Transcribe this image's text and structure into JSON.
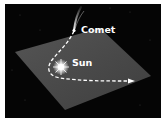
{
  "diagram": {
    "labels": {
      "comet": "Comet",
      "sun": "Sun"
    },
    "colors": {
      "background": "#050505",
      "plane": "#4a4a4a",
      "orbit": "#ffffff",
      "border": "#ffffff"
    },
    "elements": [
      "orbital-plane",
      "comet",
      "comet-tail",
      "sun",
      "orbit-path",
      "direction-arrow"
    ]
  }
}
